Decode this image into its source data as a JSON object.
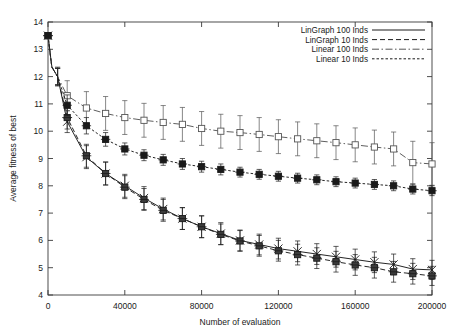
{
  "chart_data": {
    "type": "line",
    "title": "",
    "xlabel": "Number of evaluation",
    "ylabel": "Average fitness of best",
    "xlim": [
      0,
      200000
    ],
    "ylim": [
      4,
      14
    ],
    "xticks": [
      0,
      40000,
      80000,
      120000,
      160000,
      200000
    ],
    "xtick_labels": [
      "0",
      "40000",
      "80000",
      "120000",
      "160000",
      "200000"
    ],
    "yticks": [
      4,
      5,
      6,
      7,
      8,
      9,
      10,
      11,
      12,
      13,
      14
    ],
    "ytick_labels": [
      "4",
      "5",
      "6",
      "7",
      "8",
      "9",
      "10",
      "11",
      "12",
      "13",
      "14"
    ],
    "grid": false,
    "legend_position": "top-right",
    "errorbars": true,
    "series": [
      {
        "name": "LinGraph 100 Inds",
        "style": "solid",
        "marker": "cross-plus",
        "color": "#1a1a1a",
        "x": [
          0,
          2000,
          5000,
          10000,
          20000,
          30000,
          40000,
          50000,
          60000,
          70000,
          80000,
          90000,
          100000,
          110000,
          120000,
          130000,
          140000,
          150000,
          160000,
          170000,
          180000,
          190000,
          200000
        ],
        "y": [
          13.5,
          12.35,
          12.0,
          10.35,
          9.05,
          8.45,
          8.0,
          7.55,
          7.15,
          6.8,
          6.5,
          6.25,
          6.0,
          5.85,
          5.7,
          5.6,
          5.5,
          5.4,
          5.3,
          5.2,
          5.12,
          4.95,
          4.92
        ],
        "yerr": [
          0.18,
          0.15,
          0.3,
          0.4,
          0.42,
          0.42,
          0.42,
          0.42,
          0.4,
          0.4,
          0.4,
          0.4,
          0.38,
          0.38,
          0.38,
          0.38,
          0.38,
          0.38,
          0.38,
          0.38,
          0.38,
          0.38,
          0.35
        ]
      },
      {
        "name": "LinGraph 10 Inds",
        "style": "dashed",
        "marker": "cross-box",
        "color": "#1a1a1a",
        "x": [
          0,
          2000,
          5000,
          10000,
          20000,
          30000,
          40000,
          50000,
          60000,
          70000,
          80000,
          90000,
          100000,
          110000,
          120000,
          130000,
          140000,
          150000,
          160000,
          170000,
          180000,
          190000,
          200000
        ],
        "y": [
          13.5,
          12.35,
          12.0,
          10.5,
          9.1,
          8.45,
          7.95,
          7.5,
          7.1,
          6.8,
          6.5,
          6.22,
          5.98,
          5.8,
          5.62,
          5.48,
          5.35,
          5.22,
          5.1,
          5.0,
          4.85,
          4.78,
          4.7
        ],
        "yerr": [
          0.18,
          0.15,
          0.3,
          0.42,
          0.42,
          0.42,
          0.42,
          0.4,
          0.4,
          0.4,
          0.4,
          0.38,
          0.38,
          0.38,
          0.38,
          0.38,
          0.38,
          0.38,
          0.38,
          0.38,
          0.38,
          0.38,
          0.35
        ]
      },
      {
        "name": "Linear 100 Inds",
        "style": "dashdot",
        "marker": "open-square",
        "color": "#555555",
        "x": [
          0,
          2000,
          5000,
          10000,
          20000,
          30000,
          40000,
          50000,
          60000,
          70000,
          80000,
          90000,
          100000,
          110000,
          120000,
          130000,
          140000,
          150000,
          160000,
          170000,
          180000,
          190000,
          200000
        ],
        "y": [
          13.5,
          12.35,
          12.0,
          11.3,
          10.85,
          10.65,
          10.5,
          10.4,
          10.32,
          10.25,
          10.1,
          10.0,
          9.95,
          9.88,
          9.8,
          9.72,
          9.65,
          9.58,
          9.5,
          9.42,
          9.35,
          8.85,
          8.8
        ],
        "yerr": [
          0.18,
          0.15,
          0.35,
          0.55,
          0.6,
          0.62,
          0.62,
          0.62,
          0.62,
          0.62,
          0.62,
          0.62,
          0.62,
          0.62,
          0.62,
          0.62,
          0.62,
          0.62,
          0.62,
          0.62,
          0.62,
          0.78,
          0.78
        ]
      },
      {
        "name": "Linear 10 Inds",
        "style": "dashed-fine",
        "marker": "filled-square",
        "color": "#1a1a1a",
        "x": [
          0,
          2000,
          5000,
          10000,
          20000,
          30000,
          40000,
          50000,
          60000,
          70000,
          80000,
          90000,
          100000,
          110000,
          120000,
          130000,
          140000,
          150000,
          160000,
          170000,
          180000,
          190000,
          200000
        ],
        "y": [
          13.5,
          12.35,
          12.0,
          10.95,
          10.2,
          9.7,
          9.35,
          9.12,
          8.95,
          8.8,
          8.7,
          8.6,
          8.5,
          8.42,
          8.35,
          8.28,
          8.22,
          8.15,
          8.1,
          8.05,
          8.0,
          7.88,
          7.82
        ],
        "yerr": [
          0.18,
          0.15,
          0.32,
          0.38,
          0.3,
          0.25,
          0.22,
          0.2,
          0.2,
          0.2,
          0.2,
          0.2,
          0.18,
          0.18,
          0.18,
          0.18,
          0.18,
          0.18,
          0.18,
          0.18,
          0.18,
          0.18,
          0.18
        ]
      }
    ]
  },
  "legend": {
    "entries": [
      {
        "label": "LinGraph 100 Inds"
      },
      {
        "label": "LinGraph 10 Inds"
      },
      {
        "label": "Linear 100 Inds"
      },
      {
        "label": "Linear 10 Inds"
      }
    ]
  }
}
